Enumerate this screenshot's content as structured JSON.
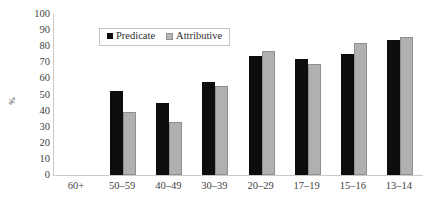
{
  "chart_data": {
    "type": "bar",
    "title": "",
    "subtitle": "",
    "xlabel": "",
    "ylabel": "%",
    "ylim": [
      0,
      100
    ],
    "ytick_step": 10,
    "yticks": [
      100,
      90,
      80,
      70,
      60,
      50,
      40,
      30,
      20,
      10,
      0
    ],
    "grid": false,
    "legend_position": "top-center",
    "categories": [
      "60+",
      "50–59",
      "40–49",
      "30–39",
      "20–29",
      "17–19",
      "15–16",
      "13–14"
    ],
    "series": [
      {
        "name": "Predicate",
        "color": "#0d0d0d",
        "values": [
          null,
          52,
          45,
          58,
          74,
          72,
          75,
          84
        ]
      },
      {
        "name": "Attributive",
        "color": "#b0b0b0",
        "values": [
          null,
          39,
          33,
          55,
          77,
          69,
          82,
          86
        ]
      }
    ]
  },
  "legend": {
    "entries": [
      {
        "label": "Predicate"
      },
      {
        "label": "Attributive"
      }
    ]
  }
}
